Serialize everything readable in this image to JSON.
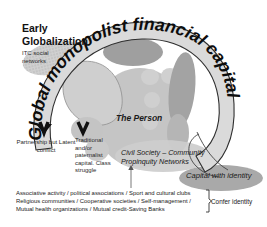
{
  "diagram": {
    "title": "Early Globalization",
    "arc_text": "Global monopolist financial capital",
    "labels": {
      "itc_networks": "ITC social networks",
      "partnership": "Partnership but Latent conflict",
      "traditional": "Traditional and/or paternalist capital. Class struggle",
      "the_person": "The Person",
      "civil_society": "Civil Society – Community Propinquity Networks",
      "capital_with_identity": "Capital with identity",
      "confer_identity": "Confer identity"
    },
    "bottom_list": [
      "Associative activity / political associations / Sport and cultural  clubs",
      "Religious communities  / Cooperative societies / Self-management  /",
      "Mutual  health organizations / Mutual credit-Saving Banks"
    ],
    "colors": {
      "arc_fill": "#d9d9d9",
      "arc_stroke": "#3a3a3a",
      "blob_dark": "#a8a8a8",
      "blob_mid": "#bdbdbd",
      "blob_light": "#d2d2d2",
      "text": "#111111"
    }
  }
}
